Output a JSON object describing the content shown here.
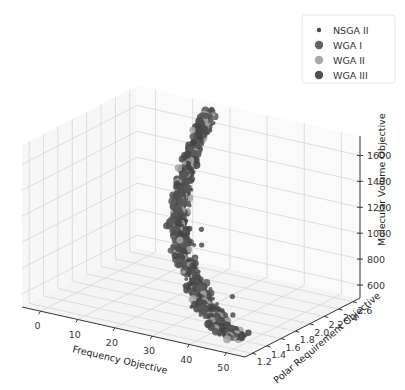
{
  "chart_data": {
    "type": "scatter3d",
    "title": "",
    "xlabel": "Frequency Objective",
    "ylabel": "Polar Requirement Objective",
    "zlabel": "Molecular Volume Objective",
    "xlim": [
      -5,
      55
    ],
    "ylim": [
      1.1,
      2.7
    ],
    "zlim": [
      500,
      1750
    ],
    "x_ticks": [
      "0",
      "10",
      "20",
      "30",
      "40",
      "50"
    ],
    "y_ticks": [
      "1.2",
      "1.4",
      "1.6",
      "1.8",
      "2.0",
      "2.2",
      "2.4",
      "2.6"
    ],
    "z_ticks": [
      "600",
      "800",
      "1000",
      "1200",
      "1400",
      "1600"
    ],
    "grid": true,
    "legend_position": "upper right",
    "series": [
      {
        "name": "NSGA II",
        "color": "#4a4a4a",
        "marker_size": 3,
        "description": "Pareto front curve from high molecular volume (~1700) at low frequency (~15-20) down to ~600 at frequency ~45-50"
      },
      {
        "name": "WGA I",
        "color": "#5f5f5f",
        "marker_size": 5
      },
      {
        "name": "WGA II",
        "color": "#9e9e9e",
        "marker_size": 5
      },
      {
        "name": "WGA III",
        "color": "#505050",
        "marker_size": 5
      }
    ],
    "front_trend": [
      {
        "x": 17,
        "y": 2.55,
        "z": 1720
      },
      {
        "x": 16,
        "y": 2.5,
        "z": 1600
      },
      {
        "x": 15,
        "y": 2.4,
        "z": 1400
      },
      {
        "x": 15,
        "y": 2.3,
        "z": 1200
      },
      {
        "x": 16,
        "y": 2.2,
        "z": 1000
      },
      {
        "x": 20,
        "y": 2.0,
        "z": 850
      },
      {
        "x": 28,
        "y": 1.8,
        "z": 720
      },
      {
        "x": 36,
        "y": 1.55,
        "z": 640
      },
      {
        "x": 44,
        "y": 1.35,
        "z": 600
      },
      {
        "x": 50,
        "y": 1.25,
        "z": 580
      }
    ]
  },
  "legend": {
    "items": [
      {
        "label": "NSGA II",
        "color": "#4a4a4a",
        "r": 2.2
      },
      {
        "label": "WGA I",
        "color": "#626262",
        "r": 4.2
      },
      {
        "label": "WGA II",
        "color": "#a8a8a8",
        "r": 4.2
      },
      {
        "label": "WGA III",
        "color": "#4f4f4f",
        "r": 4.2
      }
    ]
  }
}
